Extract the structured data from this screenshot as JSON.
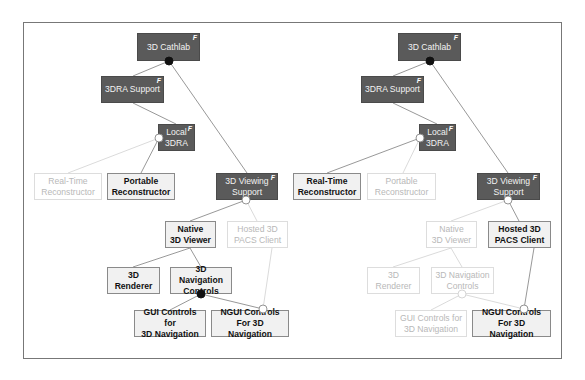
{
  "colors": {
    "abstract_fill": "#5a5a5a",
    "selected_fill": "#f1f1f1",
    "deselected_text": "#b8b8b8",
    "edge": "#8c8c8c",
    "edge_deselected": "#d6d6d6"
  },
  "panels": [
    {
      "name": "left-configuration",
      "nodes": [
        {
          "id": "cathlab",
          "label": "3D Cathlab",
          "state": "abstract",
          "badge": "F",
          "x": 137,
          "y": 33,
          "w": 63,
          "h": 28
        },
        {
          "id": "3dra-support",
          "label": "3DRA Support",
          "state": "abstract",
          "badge": "F",
          "x": 101,
          "y": 76,
          "w": 63,
          "h": 27
        },
        {
          "id": "local-3dra",
          "label": "Local\n3DRA",
          "state": "abstract",
          "badge": "F",
          "x": 158,
          "y": 124,
          "w": 37,
          "h": 27
        },
        {
          "id": "real-time-reconstructor",
          "label": "Real-Time\nReconstructor",
          "state": "deselected",
          "badge": "",
          "x": 34,
          "y": 173,
          "w": 68,
          "h": 27
        },
        {
          "id": "portable-reconstructor",
          "label": "Portable\nReconstructor",
          "state": "selected",
          "badge": "",
          "x": 107,
          "y": 173,
          "w": 68,
          "h": 27
        },
        {
          "id": "3d-viewing-support",
          "label": "3D Viewing\nSupport",
          "state": "abstract",
          "badge": "F",
          "x": 216,
          "y": 173,
          "w": 62,
          "h": 27
        },
        {
          "id": "native-3d-viewer",
          "label": "Native\n3D Viewer",
          "state": "selected",
          "badge": "",
          "x": 165,
          "y": 221,
          "w": 51,
          "h": 27
        },
        {
          "id": "hosted-3d-pacs-client",
          "label": "Hosted 3D\nPACS Client",
          "state": "deselected",
          "badge": "",
          "x": 227,
          "y": 221,
          "w": 61,
          "h": 27
        },
        {
          "id": "3d-renderer",
          "label": "3D\nRenderer",
          "state": "selected",
          "badge": "",
          "x": 107,
          "y": 267,
          "w": 53,
          "h": 27
        },
        {
          "id": "3d-navigation-controls",
          "label": "3D Navigation\nControls",
          "state": "selected",
          "badge": "",
          "x": 170,
          "y": 267,
          "w": 62,
          "h": 27
        },
        {
          "id": "gui-controls",
          "label": "GUI Controls for\n3D Navigation",
          "state": "selected",
          "badge": "",
          "x": 134,
          "y": 310,
          "w": 72,
          "h": 27
        },
        {
          "id": "ngui-controls",
          "label": "NGUI Controls\nFor 3D Navigation",
          "state": "selected",
          "badge": "",
          "x": 211,
          "y": 310,
          "w": 78,
          "h": 27
        }
      ],
      "edges": [
        {
          "x1": 169,
          "y1": 61,
          "x2": 133,
          "y2": 76,
          "state": "on"
        },
        {
          "x1": 169,
          "y1": 61,
          "x2": 247,
          "y2": 173,
          "state": "on"
        },
        {
          "x1": 133,
          "y1": 103,
          "x2": 176,
          "y2": 124,
          "state": "on"
        },
        {
          "x1": 159,
          "y1": 138,
          "x2": 68,
          "y2": 173,
          "state": "off"
        },
        {
          "x1": 159,
          "y1": 138,
          "x2": 141,
          "y2": 173,
          "state": "on"
        },
        {
          "x1": 246,
          "y1": 200,
          "x2": 190,
          "y2": 221,
          "state": "on"
        },
        {
          "x1": 246,
          "y1": 200,
          "x2": 257,
          "y2": 221,
          "state": "off"
        },
        {
          "x1": 190,
          "y1": 248,
          "x2": 133,
          "y2": 267,
          "state": "on"
        },
        {
          "x1": 190,
          "y1": 248,
          "x2": 201,
          "y2": 267,
          "state": "on"
        },
        {
          "x1": 201,
          "y1": 294,
          "x2": 170,
          "y2": 310,
          "state": "on"
        },
        {
          "x1": 201,
          "y1": 294,
          "x2": 263,
          "y2": 309,
          "state": "on"
        },
        {
          "x1": 272,
          "y1": 248,
          "x2": 263,
          "y2": 309,
          "state": "off"
        }
      ],
      "dots": [
        {
          "x": 169,
          "y": 61,
          "kind": "filled"
        },
        {
          "x": 159,
          "y": 138,
          "kind": "hollow"
        },
        {
          "x": 246,
          "y": 200,
          "kind": "hollow"
        },
        {
          "x": 201,
          "y": 294,
          "kind": "filled"
        },
        {
          "x": 263,
          "y": 309,
          "kind": "hollow"
        }
      ]
    },
    {
      "name": "right-configuration",
      "nodes": [
        {
          "id": "cathlab",
          "label": "3D Cathlab",
          "state": "abstract",
          "badge": "F",
          "x": 398,
          "y": 33,
          "w": 63,
          "h": 28
        },
        {
          "id": "3dra-support",
          "label": "3DRA Support",
          "state": "abstract",
          "badge": "F",
          "x": 361,
          "y": 76,
          "w": 63,
          "h": 27
        },
        {
          "id": "local-3dra",
          "label": "Local\n3DRA",
          "state": "abstract",
          "badge": "F",
          "x": 419,
          "y": 124,
          "w": 37,
          "h": 27
        },
        {
          "id": "real-time-reconstructor",
          "label": "Real-Time\nReconstructor",
          "state": "selected",
          "badge": "",
          "x": 293,
          "y": 173,
          "w": 68,
          "h": 27
        },
        {
          "id": "portable-reconstructor",
          "label": "Portable\nReconstructor",
          "state": "deselected",
          "badge": "",
          "x": 367,
          "y": 173,
          "w": 69,
          "h": 27
        },
        {
          "id": "3d-viewing-support",
          "label": "3D Viewing\nSupport",
          "state": "abstract",
          "badge": "F",
          "x": 477,
          "y": 173,
          "w": 63,
          "h": 27
        },
        {
          "id": "native-3d-viewer",
          "label": "Native\n3D Viewer",
          "state": "deselected",
          "badge": "",
          "x": 426,
          "y": 221,
          "w": 51,
          "h": 27
        },
        {
          "id": "hosted-3d-pacs-client",
          "label": "Hosted 3D\nPACS Client",
          "state": "selected",
          "badge": "",
          "x": 488,
          "y": 221,
          "w": 63,
          "h": 27
        },
        {
          "id": "3d-renderer",
          "label": "3D\nRenderer",
          "state": "deselected",
          "badge": "",
          "x": 367,
          "y": 267,
          "w": 53,
          "h": 27
        },
        {
          "id": "3d-navigation-controls",
          "label": "3D Navigation\nControls",
          "state": "deselected",
          "badge": "",
          "x": 431,
          "y": 267,
          "w": 63,
          "h": 27
        },
        {
          "id": "gui-controls",
          "label": "GUI Controls for\n3D Navigation",
          "state": "deselected",
          "badge": "",
          "x": 395,
          "y": 310,
          "w": 72,
          "h": 27
        },
        {
          "id": "ngui-controls",
          "label": "NGUI Controls\nFor 3D Navigation",
          "state": "selected",
          "badge": "",
          "x": 472,
          "y": 310,
          "w": 79,
          "h": 27
        }
      ],
      "edges": [
        {
          "x1": 430,
          "y1": 61,
          "x2": 393,
          "y2": 76,
          "state": "on"
        },
        {
          "x1": 430,
          "y1": 61,
          "x2": 508,
          "y2": 173,
          "state": "on"
        },
        {
          "x1": 393,
          "y1": 103,
          "x2": 437,
          "y2": 124,
          "state": "on"
        },
        {
          "x1": 420,
          "y1": 138,
          "x2": 327,
          "y2": 173,
          "state": "on"
        },
        {
          "x1": 420,
          "y1": 138,
          "x2": 403,
          "y2": 173,
          "state": "off"
        },
        {
          "x1": 508,
          "y1": 200,
          "x2": 451,
          "y2": 221,
          "state": "off"
        },
        {
          "x1": 508,
          "y1": 200,
          "x2": 519,
          "y2": 221,
          "state": "on"
        },
        {
          "x1": 451,
          "y1": 248,
          "x2": 393,
          "y2": 267,
          "state": "off"
        },
        {
          "x1": 451,
          "y1": 248,
          "x2": 462,
          "y2": 267,
          "state": "off"
        },
        {
          "x1": 462,
          "y1": 294,
          "x2": 431,
          "y2": 310,
          "state": "off"
        },
        {
          "x1": 462,
          "y1": 294,
          "x2": 524,
          "y2": 309,
          "state": "off"
        },
        {
          "x1": 534,
          "y1": 248,
          "x2": 524,
          "y2": 309,
          "state": "on"
        }
      ],
      "dots": [
        {
          "x": 430,
          "y": 61,
          "kind": "filled"
        },
        {
          "x": 420,
          "y": 138,
          "kind": "hollow"
        },
        {
          "x": 508,
          "y": 200,
          "kind": "hollow"
        },
        {
          "x": 462,
          "y": 294,
          "kind": "hollow-faint"
        },
        {
          "x": 524,
          "y": 309,
          "kind": "hollow"
        }
      ]
    }
  ]
}
